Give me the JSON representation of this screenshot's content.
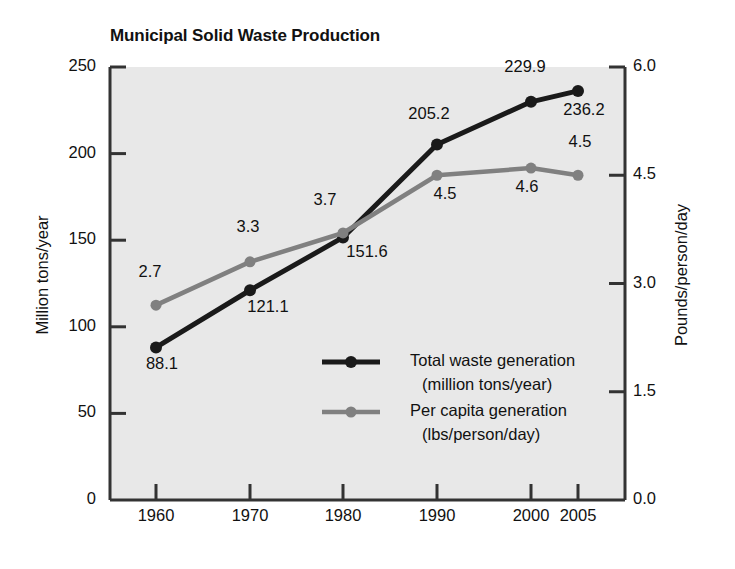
{
  "chart_data": {
    "type": "line",
    "title": "Municipal Solid Waste Production",
    "xlabel": "",
    "ylabel": "Million tons/year",
    "y2label": "Pounds/person/day",
    "categories": [
      "1960",
      "1970",
      "1980",
      "1990",
      "2000",
      "2005"
    ],
    "x": [
      1960,
      1970,
      1980,
      1990,
      2000,
      2005
    ],
    "ylim": [
      0,
      250
    ],
    "y2lim": [
      0.0,
      6.0
    ],
    "yticks": [
      "0",
      "50",
      "100",
      "150",
      "200",
      "250"
    ],
    "ytick_values": [
      0,
      50,
      100,
      150,
      200,
      250
    ],
    "y2ticks": [
      "0.0",
      "1.5",
      "3.0",
      "4.5",
      "6.0"
    ],
    "y2tick_values": [
      0.0,
      1.5,
      3.0,
      4.5,
      6.0
    ],
    "grid": false,
    "legend_position": "center-right",
    "plot_background": "#e8e8e8",
    "series": [
      {
        "name": "Total waste generation",
        "unit": "(million tons/year)",
        "axis": "left",
        "color": "#1a1a1a",
        "values": [
          88.1,
          121.1,
          151.6,
          205.2,
          229.9,
          236.2
        ],
        "labels": [
          "88.1",
          "121.1",
          "151.6",
          "205.2",
          "229.9",
          "236.2"
        ]
      },
      {
        "name": "Per capita generation",
        "unit": "(lbs/person/day)",
        "axis": "right",
        "color": "#808080",
        "values": [
          2.7,
          3.3,
          3.7,
          4.5,
          4.6,
          4.5
        ],
        "labels": [
          "2.7",
          "3.3",
          "3.7",
          "4.5",
          "4.6",
          "4.5"
        ]
      }
    ]
  },
  "legend": {
    "entries": [
      {
        "line1": "Total waste generation",
        "line2": "(million tons/year)",
        "swatch": "#1a1a1a"
      },
      {
        "line1": "Per capita generation",
        "line2": "(lbs/person/day)",
        "swatch": "#808080"
      }
    ]
  },
  "colors": {
    "total_waste_line": "#1a1a1a",
    "per_capita_line": "#808080",
    "plot_area": "#e8e8e8",
    "axis": "#333333",
    "text": "#111111",
    "page_background": "#ffffff"
  }
}
